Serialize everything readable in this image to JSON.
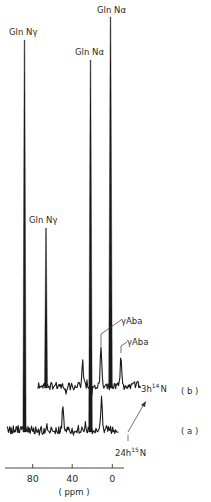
{
  "chart_data": {
    "type": "line",
    "title": "",
    "xlabel": "(ppm)",
    "ylabel": "",
    "x_axis": {
      "ticks": [
        80,
        40,
        0
      ],
      "tick_labels": [
        "80",
        "40",
        "0"
      ],
      "direction": "reversed (high ppm on left)",
      "range_ppm": [
        106,
        -12
      ]
    },
    "grid": false,
    "series": [
      {
        "name": "(a)",
        "label": "24h 15N",
        "label_main": "24h",
        "label_sup": "15",
        "label_end": "N",
        "baseline_y_px": 430,
        "x_offset_px": 0,
        "x_range_px": [
          7,
          119
        ],
        "peaks": [
          {
            "label": "Gln Nγ",
            "ppm": 88,
            "x_px": 24.5,
            "top_y_px": 40,
            "width": 1.6
          },
          {
            "label": "Gln Nα",
            "ppm": 22,
            "x_px": 90.5,
            "top_y_px": 60,
            "width": 1.8
          },
          {
            "label": "",
            "ppm": 50,
            "x_px": 63,
            "top_y_px": 405,
            "width": 1.2
          },
          {
            "label": "",
            "ppm": 11,
            "x_px": 101.5,
            "top_y_px": 398,
            "width": 1.3
          }
        ]
      },
      {
        "name": "(b)",
        "label": "3h 14N",
        "label_main": "3h",
        "label_sup": "14",
        "label_end": "N",
        "baseline_y_px": 386,
        "x_offset_px": 20,
        "x_range_px": [
          38,
          141
        ],
        "peaks": [
          {
            "label": "Gln Nγ",
            "ppm": 88,
            "x_px": 46,
            "top_y_px": 228,
            "width": 1.5
          },
          {
            "label": "Gln Nα",
            "ppm": 22,
            "x_px": 110.5,
            "top_y_px": 17,
            "width": 1.8
          },
          {
            "label": "",
            "ppm": 62,
            "x_px": 82.5,
            "top_y_px": 362,
            "width": 1.3
          },
          {
            "label": "γAba",
            "ppm": 11,
            "x_px": 101,
            "top_y_px": 349,
            "width": 1.3
          },
          {
            "label": "γAba",
            "ppm": -9,
            "x_px": 121,
            "top_y_px": 356,
            "width": 1.3
          }
        ]
      }
    ],
    "annotations": [
      {
        "text": "Gln Nγ",
        "x_px": 9,
        "y_px": 35
      },
      {
        "text": "Gln Nα",
        "x_px": 76,
        "y_px": 55
      },
      {
        "text": "Gln Nα",
        "x_px": 98,
        "y_px": 13
      },
      {
        "text": "Gln Nγ",
        "x_px": 30,
        "y_px": 222
      },
      {
        "text": "γAba",
        "x_px": 121,
        "y_px": 324
      },
      {
        "text": "γAba",
        "x_px": 127,
        "y_px": 345
      }
    ]
  },
  "labels": {
    "peak_gln_ngamma_a": "Gln Nγ",
    "peak_gln_nalpha_a": "Gln Nα",
    "peak_gln_nalpha_b": "Gln Nα",
    "peak_gln_ngamma_b": "Gln Nγ",
    "gaba_1": "γAba",
    "gaba_2": "γAba",
    "trace_b_main": "3h",
    "trace_b_sup": "14",
    "trace_b_end": "N",
    "trace_a_main": "24h",
    "trace_a_sup": "15",
    "trace_a_end": "N",
    "series_b_tag": "( b )",
    "series_a_tag": "( a )",
    "tick_80": "80",
    "tick_40": "40",
    "tick_0": "0",
    "axis_unit": "( ppm )"
  },
  "colors": {
    "ink": "#1a1a1a",
    "background": "#ffffff"
  }
}
